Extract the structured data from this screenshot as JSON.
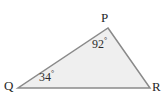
{
  "figure": {
    "type": "triangle-diagram",
    "background_color": "#ffffff",
    "fill_color": "#efefef",
    "stroke_color": "#8a8a8a",
    "stroke_width": 1.5,
    "label_color": "#272727"
  },
  "vertices": [
    {
      "name": "P",
      "label": "P",
      "x": 108,
      "y": 28,
      "label_x": 101,
      "label_y": 11
    },
    {
      "name": "Q",
      "label": "Q",
      "x": 18,
      "y": 88,
      "label_x": 4,
      "label_y": 79
    },
    {
      "name": "R",
      "label": "R",
      "x": 150,
      "y": 88,
      "label_x": 152,
      "label_y": 80
    }
  ],
  "angles": [
    {
      "at_vertex": "P",
      "value": "92",
      "degree_symbol": "°",
      "text": "92°"
    },
    {
      "at_vertex": "Q",
      "value": "34",
      "degree_symbol": "°",
      "text": "34°"
    }
  ],
  "chart_data": {
    "type": "diagram",
    "shape": "triangle",
    "points": {
      "P": [
        108,
        28
      ],
      "Q": [
        18,
        88
      ],
      "R": [
        150,
        88
      ]
    },
    "edges": [
      [
        "Q",
        "P"
      ],
      [
        "P",
        "R"
      ],
      [
        "R",
        "Q"
      ]
    ],
    "angle_labels": {
      "P": 92,
      "Q": 34
    },
    "angle_unit": "degrees"
  }
}
